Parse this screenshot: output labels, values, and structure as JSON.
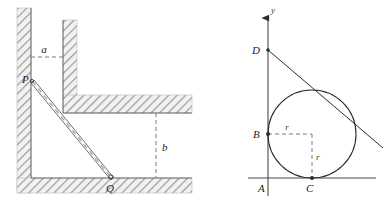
{
  "figure": {
    "panels": [
      {
        "id": "left-panel",
        "name": "ladder-in-corner-diagram",
        "description": "Hatched walls forming a corner with a ladder PQ leaning across, distances a and b marked by dashed lines",
        "labels": {
          "point_p": "P",
          "point_q": "Q",
          "distance_a": "a",
          "distance_b": "b"
        },
        "geometry": {
          "left_wall": {
            "x": 17,
            "y": 8,
            "width": 14,
            "height": 185
          },
          "inner_wall": {
            "x": 63,
            "y": 20,
            "width": 14,
            "height": 93
          },
          "shelf": {
            "x": 63,
            "y": 95,
            "width": 129,
            "height": 18
          },
          "floor": {
            "x": 17,
            "y": 178,
            "width": 175,
            "height": 15
          },
          "point_p": {
            "x": 31,
            "y": 82
          },
          "point_q": {
            "x": 110,
            "y": 178
          },
          "dashed_a": {
            "x1": 31,
            "y1": 57,
            "x2": 63,
            "y2": 57
          },
          "dashed_b": {
            "x1": 156,
            "y1": 113,
            "x2": 156,
            "y2": 178
          },
          "label_a": {
            "x": 46,
            "y": 52
          },
          "label_b": {
            "x": 161,
            "y": 150
          }
        }
      },
      {
        "id": "right-panel",
        "name": "circle-tangent-diagram",
        "description": "Coordinate axes with a circle tangent to both axes, tangent line through D, radii r marked",
        "labels": {
          "y_axis": "y",
          "point_a": "A",
          "point_b": "B",
          "point_c": "C",
          "point_d": "D",
          "radius_horizontal": "r",
          "radius_vertical": "r"
        },
        "geometry": {
          "y_axis": {
            "x": 268,
            "y_top": 14,
            "y_bottom": 196
          },
          "x_axis": {
            "y": 178,
            "x_left": 248,
            "x_right": 376
          },
          "circle": {
            "cx": 312,
            "cy": 134,
            "r": 44
          },
          "point_a": {
            "x": 268,
            "y": 178
          },
          "point_b": {
            "x": 268,
            "y": 134
          },
          "point_c": {
            "x": 312,
            "y": 178
          },
          "point_d": {
            "x": 268,
            "y": 50
          },
          "tangent_line": {
            "x1": 268,
            "y1": 50,
            "x2": 383,
            "y2": 148
          },
          "dashed_r_horizontal": {
            "x1": 268,
            "y1": 134,
            "x2": 312,
            "y2": 134
          },
          "dashed_r_vertical": {
            "x1": 312,
            "y1": 134,
            "x2": 312,
            "y2": 178
          },
          "label_y": {
            "x": 272,
            "y": 12
          },
          "label_a": {
            "x": 261,
            "y": 192
          },
          "label_b": {
            "x": 257,
            "y": 138
          },
          "label_c": {
            "x": 309,
            "y": 192
          },
          "label_d": {
            "x": 256,
            "y": 48
          },
          "label_r_h": {
            "x": 287,
            "y": 129
          },
          "label_r_v": {
            "x": 316,
            "y": 160
          }
        }
      }
    ],
    "colors": {
      "ink": "#2b2b2b",
      "hatch": "#8a8a8a",
      "hatch_fill": "#f0f0f0",
      "dashed": "#7a7a7a",
      "ladder": "#9a9a9a",
      "background": "#ffffff"
    }
  }
}
